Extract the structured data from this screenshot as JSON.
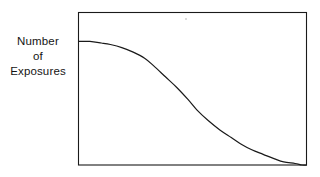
{
  "figure": {
    "background_color": "#ffffff",
    "line_color": "#1a1a1a",
    "frame_color": "#1a1a1a"
  },
  "axis_label": {
    "name": "y-axis-label",
    "line1": "Number",
    "line2": "of",
    "line3": "Exposures",
    "full_text": "Number of Exposures"
  },
  "chart_data": {
    "type": "line",
    "title": "",
    "subtitle": "",
    "xlabel": "",
    "ylabel": "Number of Exposures",
    "grid": false,
    "legend": null,
    "legend_position": "none",
    "x_tick_labels": [],
    "y_tick_labels": [],
    "xlim": [
      0,
      100
    ],
    "ylim": [
      0,
      100
    ],
    "annotations": [],
    "series": [
      {
        "name": "Number of Exposures",
        "style": "solid",
        "color": "#1a1a1a",
        "x": [
          0,
          5,
          10,
          14,
          19,
          24,
          29,
          33,
          38,
          43,
          48,
          52,
          57,
          62,
          67,
          71,
          76,
          81,
          86,
          90,
          95,
          98,
          100
        ],
        "y": [
          81,
          81,
          80,
          79,
          77,
          74,
          70,
          65,
          58,
          51,
          43,
          36,
          29,
          23,
          18,
          14,
          10,
          7,
          4,
          2,
          1,
          0,
          0
        ]
      }
    ]
  }
}
